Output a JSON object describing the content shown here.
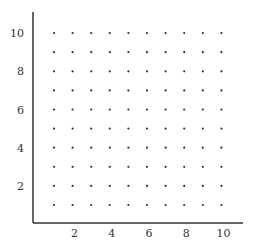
{
  "chart_data": {
    "type": "scatter",
    "title": "",
    "xlabel": "",
    "ylabel": "",
    "xlim": [
      0,
      10.5
    ],
    "ylim": [
      0,
      10.5
    ],
    "grid": false,
    "legend": null,
    "x_ticks": [
      "2",
      "4",
      "6",
      "8",
      "10"
    ],
    "y_ticks": [
      "2",
      "4",
      "6",
      "8",
      "10"
    ],
    "x": [
      1,
      2,
      3,
      4,
      5,
      6,
      7,
      8,
      9,
      10
    ],
    "y": [
      1,
      2,
      3,
      4,
      5,
      6,
      7,
      8,
      9,
      10
    ],
    "point_count": 100
  },
  "style": {
    "axis_color": "#333333",
    "point_color": "#333333"
  }
}
